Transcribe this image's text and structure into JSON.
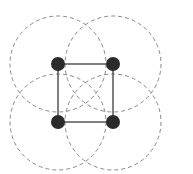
{
  "diagram": {
    "type": "graph-with-coverage-circles",
    "colors": {
      "node": "#2b2b2b",
      "edge": "#555555",
      "circle": "#888888",
      "background": "#ffffff"
    },
    "coverage_radius": 48,
    "node_radius": 7,
    "nodes": [
      {
        "id": "top-left",
        "cx": 58,
        "cy": 64
      },
      {
        "id": "top-right",
        "cx": 113,
        "cy": 64
      },
      {
        "id": "bottom-left",
        "cx": 58,
        "cy": 122
      },
      {
        "id": "bottom-right",
        "cx": 113,
        "cy": 122
      }
    ],
    "edges": [
      {
        "from": "top-left",
        "to": "top-right"
      },
      {
        "from": "top-right",
        "to": "bottom-right"
      },
      {
        "from": "bottom-left",
        "to": "bottom-right"
      },
      {
        "from": "top-left",
        "to": "bottom-left"
      }
    ]
  }
}
